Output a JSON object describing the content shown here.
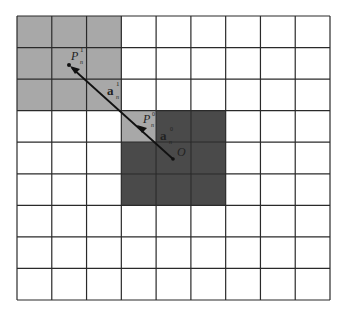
{
  "diagram": {
    "grid": {
      "cols": 9,
      "rows": 9,
      "x0": 17,
      "y0": 16,
      "x1": 330,
      "y1": 300,
      "line_color": "#2a2a2a",
      "background": "#ffffff"
    },
    "regions": {
      "light": {
        "color": "#a8a8a8",
        "cells": [
          [
            0,
            0
          ],
          [
            0,
            1
          ],
          [
            0,
            2
          ],
          [
            1,
            0
          ],
          [
            1,
            1
          ],
          [
            1,
            2
          ],
          [
            2,
            0
          ],
          [
            2,
            1
          ],
          [
            2,
            2
          ],
          [
            3,
            3
          ]
        ]
      },
      "dark": {
        "color": "#4a4a4a",
        "cells": [
          [
            3,
            4
          ],
          [
            3,
            5
          ],
          [
            4,
            3
          ],
          [
            4,
            4
          ],
          [
            4,
            5
          ],
          [
            5,
            3
          ],
          [
            5,
            4
          ],
          [
            5,
            5
          ]
        ]
      }
    },
    "points": {
      "origin": {
        "label": "O",
        "x": 173,
        "y": 159
      },
      "p1": {
        "label": "P",
        "sup": "1",
        "sub": "n",
        "x": 69,
        "y": 65
      },
      "p0": {
        "label": "P",
        "sup": "0",
        "sub": "n",
        "x": 139,
        "y": 127
      }
    },
    "vectors": {
      "a1": {
        "label": "a",
        "sup": "1",
        "sub": "n"
      },
      "a0": {
        "label": "a",
        "sup": "0",
        "sub": "n"
      }
    }
  }
}
